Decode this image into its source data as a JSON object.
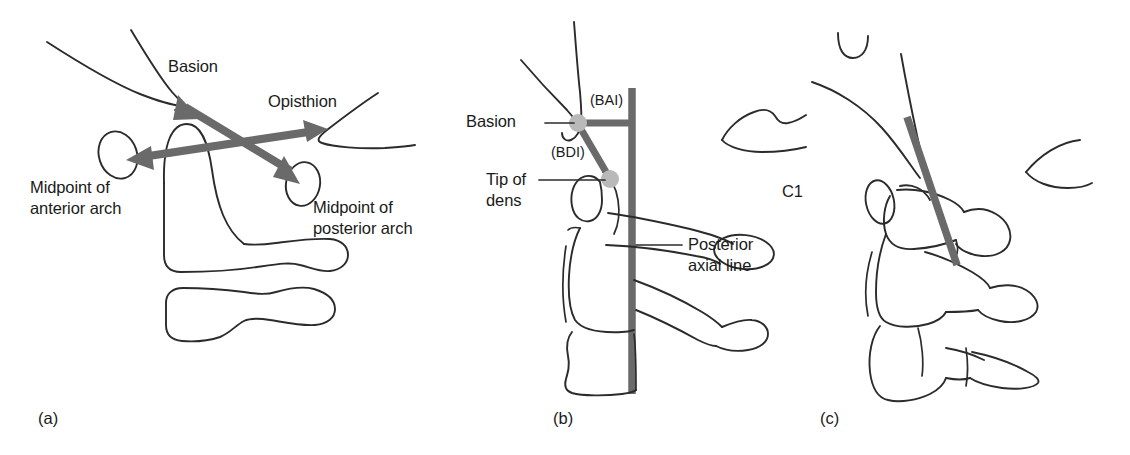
{
  "figure": {
    "background": "#ffffff",
    "ink_color": "#2b2b2b",
    "measure_color": "#6a6a6a",
    "landmark_dot_color": "#b9b9b9",
    "width": 1130,
    "height": 455
  },
  "panels": [
    {
      "id": "a",
      "label": "(a)",
      "caption_topic": "Powers ratio landmarks",
      "labels": {
        "basion": "Basion",
        "opisthion": "Opisthion",
        "midpoint_anterior_arch_line1": "Midpoint of",
        "midpoint_anterior_arch_line2": "anterior arch",
        "midpoint_posterior_arch_line1": "Midpoint of",
        "midpoint_posterior_arch_line2": "posterior arch"
      },
      "measurements": [
        {
          "name": "basion-to-midpoint-posterior-arch",
          "from": "Basion",
          "to": "Midpoint of posterior arch",
          "style": "double-headed-arrow"
        },
        {
          "name": "opisthion-to-midpoint-anterior-arch",
          "from": "Opisthion",
          "to": "Midpoint of anterior arch",
          "style": "double-headed-arrow"
        }
      ]
    },
    {
      "id": "b",
      "label": "(b)",
      "caption_topic": "BAI / BDI relative to posterior axial line",
      "labels": {
        "basion": "Basion",
        "bai": "(BAI)",
        "bdi": "(BDI)",
        "tip_of_dens_line1": "Tip of",
        "tip_of_dens_line2": "dens",
        "c1": "C1",
        "posterior_axial_line1": "Posterior",
        "posterior_axial_line2": "axial line"
      },
      "measurements": [
        {
          "name": "basion-axial-interval",
          "abbr": "(BAI)",
          "style": "horizontal-bar",
          "from": "Basion",
          "to": "Posterior axial line"
        },
        {
          "name": "basion-dens-interval",
          "abbr": "(BDI)",
          "style": "diagonal-bar",
          "from": "Basion",
          "to": "Tip of dens"
        },
        {
          "name": "posterior-axial-line",
          "style": "vertical-reference-line"
        }
      ]
    },
    {
      "id": "c",
      "label": "(c)",
      "caption_topic": "Posterior axial line extended through C2",
      "labels": {},
      "measurements": [
        {
          "name": "posterior-axial-line-extended",
          "style": "oblique-reference-line"
        }
      ]
    }
  ]
}
